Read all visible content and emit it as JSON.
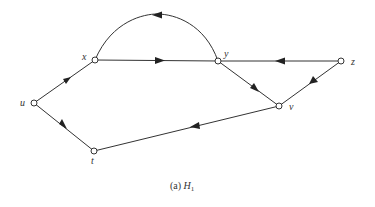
{
  "diagram": {
    "type": "directed-graph",
    "caption_prefix": "(a) ",
    "caption_name": "H",
    "caption_sub": "1",
    "nodes": [
      {
        "id": "u",
        "label": "u"
      },
      {
        "id": "x",
        "label": "x"
      },
      {
        "id": "y",
        "label": "y"
      },
      {
        "id": "z",
        "label": "z"
      },
      {
        "id": "v",
        "label": "v"
      },
      {
        "id": "t",
        "label": "t"
      }
    ],
    "edges": [
      {
        "from": "u",
        "to": "x"
      },
      {
        "from": "u",
        "to": "t"
      },
      {
        "from": "x",
        "to": "y"
      },
      {
        "from": "y",
        "to": "x",
        "curved": true
      },
      {
        "from": "z",
        "to": "y"
      },
      {
        "from": "z",
        "to": "v"
      },
      {
        "from": "y",
        "to": "v"
      },
      {
        "from": "v",
        "to": "t"
      }
    ]
  }
}
